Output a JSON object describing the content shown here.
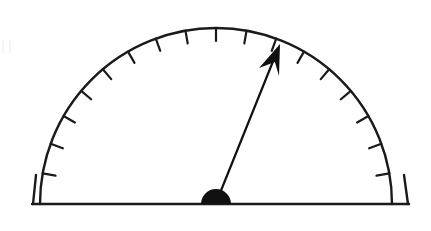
{
  "figure": {
    "name": "protractor-gauge",
    "type": "semicircular-protractor-dial",
    "width": 431,
    "height": 231,
    "background_color": "#ffffff",
    "stroke_color": "#1a1a1a",
    "fill_color": "#111111"
  },
  "geometry": {
    "center_x": 216,
    "center_y": 204,
    "arc_radius": 176,
    "baseline_left_x": 32,
    "baseline_right_x": 409,
    "baseline_y": 204,
    "arc_stroke_width": 2.4,
    "baseline_stroke_width": 2.4
  },
  "scale": {
    "label": "tick-scale",
    "start_angle_deg": 0,
    "end_angle_deg": 180,
    "tick_interval_deg": 10,
    "tick_count": 17,
    "tick_length": 13,
    "tick_stroke_width": 2.2,
    "tick_direction": "inward",
    "tick_angles_deg": [
      10,
      20,
      30,
      40,
      50,
      60,
      70,
      80,
      90,
      100,
      110,
      120,
      130,
      140,
      150,
      160,
      170
    ]
  },
  "pointer": {
    "label": "pointer-arrow",
    "angle_deg": 68.6,
    "tip_x": 280,
    "tip_y": 44,
    "tail_x": 216,
    "tail_y": 203,
    "shaft_stroke_width": 2.2,
    "arrowhead_length": 30,
    "arrowhead_half_width": 11,
    "color": "#111111"
  },
  "pivot": {
    "label": "pivot-hub",
    "center_x": 216,
    "center_y": 204,
    "radius": 15,
    "shape": "half-disc",
    "color": "#111111"
  },
  "chart_data": {
    "type": "gauge",
    "title": "",
    "subtitle": "",
    "xlabel": "",
    "ylabel": "",
    "min": 0,
    "max": 180,
    "unit": "degrees",
    "value": 68.6,
    "tick_interval": 10,
    "tick_labels": [],
    "legend": [],
    "grid": false,
    "annotations": []
  }
}
